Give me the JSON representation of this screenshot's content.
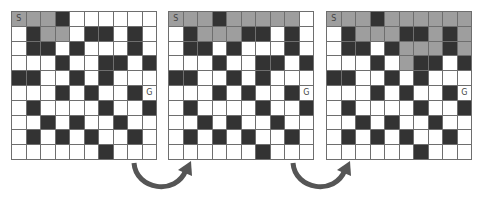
{
  "colors": {
    "wall": "#333333",
    "visited": "#9e9e9e",
    "open": "#ffffff",
    "grid_line": "#6e6e6e",
    "arrow": "#555555"
  },
  "legend_codes": {
    "W": "open",
    "B": "wall",
    "G": "visited",
    "S": "start",
    "E": "goal"
  },
  "labels": {
    "start": "S",
    "goal": "G"
  },
  "grids": [
    {
      "name": "step-1",
      "rows": [
        "SGGBWWWWWW",
        "WBGGWBBWBW",
        "WBBWBWWWBW",
        "WWWBWWBBWB",
        "BBWWBWBWWW",
        "WWWBWBWWBE",
        "WBWWWWBWWB",
        "WWBWBWWBWW",
        "WBWBWBWWBW",
        "WWWWWWBWWW"
      ]
    },
    {
      "name": "step-2",
      "rows": [
        "SGGBGGGGGW",
        "WBGGGBBWBW",
        "WBBWBWWWBW",
        "WWWBWWBBWB",
        "BBWWBWBWWW",
        "WWWBWBWWBE",
        "WBWWWWBWWB",
        "WWBWBWWBWW",
        "WBWBWBWWBW",
        "WWWWWWBWWW"
      ]
    },
    {
      "name": "step-3",
      "rows": [
        "SGGBGGGGGG",
        "WBGGGBBGBG",
        "WBBWBGGGBG",
        "WWWBWGBBWB",
        "BBWWBWBWWW",
        "WWWBWBWWBE",
        "WBWWWWBWWB",
        "WWBWBWWBWW",
        "WBWBWBWWBW",
        "WWWWWWBWWW"
      ]
    }
  ],
  "arrows": [
    {
      "from": "step-1",
      "to": "step-2"
    },
    {
      "from": "step-2",
      "to": "step-3"
    }
  ]
}
